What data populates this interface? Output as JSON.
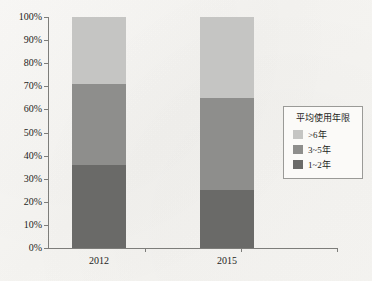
{
  "chart_data": {
    "type": "bar",
    "stacked": true,
    "normalized": true,
    "title": "",
    "subtitle": "",
    "xlabel": "",
    "ylabel": "",
    "categories": [
      "2012",
      "2015"
    ],
    "series": [
      {
        "name": "1~2年",
        "values": [
          36,
          25
        ],
        "color": "#6a6a68"
      },
      {
        "name": "3~5年",
        "values": [
          35,
          40
        ],
        "color": "#8e8e8c"
      },
      {
        "name": ">6年",
        "values": [
          29,
          35
        ],
        "color": "#c5c5c3"
      }
    ],
    "stack_order_bottom_to_top": [
      "1~2年",
      "3~5年",
      ">6年"
    ],
    "cumulative_tops": {
      "2012": {
        "1~2年": 36,
        "3~5年": 71,
        ">6年": 100
      },
      "2015": {
        "1~2年": 25,
        "3~5年": 65,
        ">6年": 100
      }
    },
    "ylim": [
      0,
      100
    ],
    "ytick_values": [
      0,
      10,
      20,
      30,
      40,
      50,
      60,
      70,
      80,
      90,
      100
    ],
    "ytick_labels": [
      "0%",
      "10%",
      "20%",
      "30%",
      "40%",
      "50%",
      "60%",
      "70%",
      "80%",
      "90%",
      "100%"
    ],
    "grid": false,
    "legend_position": "right",
    "legend": {
      "title": "平均使用年限",
      "entries": [
        {
          "label": ">6年",
          "color": "#c5c5c3"
        },
        {
          "label": "3~5年",
          "color": "#8e8e8c"
        },
        {
          "label": "1~2年",
          "color": "#6a6a68"
        }
      ]
    },
    "colors": {
      "background": "#f7f6f3",
      "axis": "#7d7d7a",
      "text": "#1d1d1b",
      "series_low": "#6a6a68",
      "series_mid": "#8e8e8c",
      "series_high": "#c5c5c3"
    }
  },
  "axis": {
    "y_labels": [
      "100%",
      "90%",
      "80%",
      "70%",
      "60%",
      "50%",
      "40%",
      "30%",
      "20%",
      "10%",
      "0%"
    ],
    "x_labels": [
      "2012",
      "2015"
    ]
  }
}
